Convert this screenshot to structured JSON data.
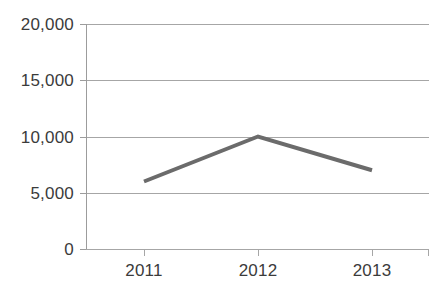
{
  "chart_data": {
    "type": "line",
    "title": "",
    "xlabel": "",
    "ylabel": "",
    "categories": [
      "2011",
      "2012",
      "2013"
    ],
    "values": [
      6000,
      10000,
      7000
    ],
    "series": [
      {
        "name": "Series 1",
        "values": [
          6000,
          10000,
          7000
        ]
      }
    ],
    "ylim": [
      0,
      20000
    ],
    "y_ticks": [
      0,
      5000,
      10000,
      15000,
      20000
    ],
    "y_tick_labels": [
      "0",
      "5,000",
      "10,000",
      "15,000",
      "20,000"
    ],
    "x_tick_labels": [
      "2011",
      "2012",
      "2013"
    ],
    "grid": true,
    "grid_axis": "y",
    "legend": false,
    "legend_position": "none",
    "markers": false
  },
  "style": {
    "line_color": "#6b6b6b",
    "grid_color": "#a6a6a6",
    "axis_color": "#9c9c9c",
    "text_color": "#3b3b3b",
    "background": "#ffffff",
    "line_width": 4
  },
  "axis": {
    "y_labels": [
      "20,000",
      "15,000",
      "10,000",
      "5,000",
      "0"
    ],
    "x_labels": [
      "2011",
      "2012",
      "2013"
    ]
  }
}
